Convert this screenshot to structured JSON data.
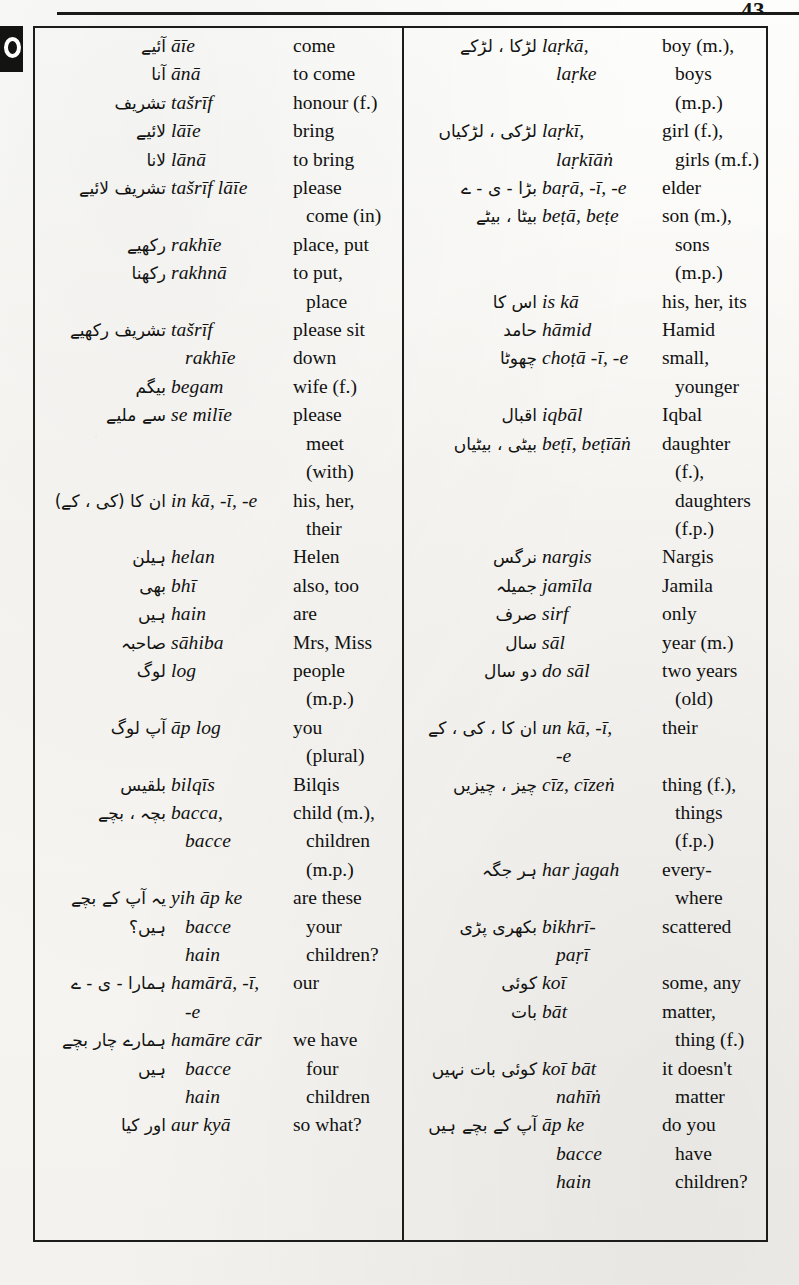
{
  "page": {
    "folio": "43",
    "thumb_tab_icon": "thumb-index-ring-icon"
  },
  "glossary": {
    "left_column": [
      {
        "urdu": "آئیے",
        "translit": "āīe",
        "gloss": "come"
      },
      {
        "urdu": "آنا",
        "translit": "ānā",
        "gloss": "to come"
      },
      {
        "urdu": "تشریف",
        "translit": "tašrīf",
        "gloss": "honour (f.)"
      },
      {
        "urdu": "لائیے",
        "translit": "lāīe",
        "gloss": "bring"
      },
      {
        "urdu": "لانا",
        "translit": "lānā",
        "gloss": "to bring"
      },
      {
        "urdu": "تشریف لائیے",
        "translit": "tašrīf lāīe",
        "gloss": "please"
      },
      {
        "urdu": "",
        "translit": "",
        "gloss": "come (in)",
        "cont": true,
        "indent_gloss": true
      },
      {
        "urdu": "رکھیے",
        "translit": "rakhīe",
        "gloss": "place, put"
      },
      {
        "urdu": "رکھنا",
        "translit": "rakhnā",
        "gloss": "to put,"
      },
      {
        "urdu": "",
        "translit": "",
        "gloss": "place",
        "cont": true,
        "indent_gloss": true
      },
      {
        "urdu": "تشریف رکھیے",
        "translit": "tašrīf",
        "gloss": "please sit"
      },
      {
        "urdu": "",
        "translit": "rakhīe",
        "gloss": "down",
        "cont": true,
        "indent_translit": true
      },
      {
        "urdu": "بیگم",
        "translit": "begam",
        "gloss": "wife (f.)"
      },
      {
        "urdu": "سے ملیے",
        "translit": "se milīe",
        "gloss": "please"
      },
      {
        "urdu": "",
        "translit": "",
        "gloss": "meet",
        "cont": true,
        "indent_gloss": true
      },
      {
        "urdu": "",
        "translit": "",
        "gloss": "(with)",
        "cont": true,
        "indent_gloss": true
      },
      {
        "urdu": "ان کا (کی ، کے)",
        "translit": "in kā, -ī, -e",
        "gloss": "his, her,"
      },
      {
        "urdu": "",
        "translit": "",
        "gloss": "their",
        "cont": true,
        "indent_gloss": true
      },
      {
        "urdu": "ہیلن",
        "translit": "helan",
        "gloss": "Helen"
      },
      {
        "urdu": "بھی",
        "translit": "bhī",
        "gloss": "also, too"
      },
      {
        "urdu": "ہیں",
        "translit": "hain",
        "gloss": "are"
      },
      {
        "urdu": "صاحبہ",
        "translit": "sāhiba",
        "gloss": "Mrs, Miss"
      },
      {
        "urdu": "لوگ",
        "translit": "log",
        "gloss": "people"
      },
      {
        "urdu": "",
        "translit": "",
        "gloss": "(m.p.)",
        "cont": true,
        "indent_gloss": true
      },
      {
        "urdu": "آپ لوگ",
        "translit": "āp log",
        "gloss": "you"
      },
      {
        "urdu": "",
        "translit": "",
        "gloss": "(plural)",
        "cont": true,
        "indent_gloss": true
      },
      {
        "urdu": "بلقیس",
        "translit": "bilqīs",
        "gloss": "Bilqis"
      },
      {
        "urdu": "بچہ ، بچے",
        "translit": "bacca,",
        "gloss": "child (m.),"
      },
      {
        "urdu": "",
        "translit": "bacce",
        "gloss": "children",
        "cont": true,
        "indent_translit": true,
        "indent_gloss": true
      },
      {
        "urdu": "",
        "translit": "",
        "gloss": "(m.p.)",
        "cont": true,
        "indent_gloss": true
      },
      {
        "urdu": "یہ آپ کے بچے",
        "translit": "yih āp ke",
        "gloss": "are these"
      },
      {
        "urdu": "ہیں؟",
        "translit": "bacce",
        "gloss": "your",
        "cont": false,
        "indent_translit": true,
        "indent_gloss": true
      },
      {
        "urdu": "",
        "translit": "hain",
        "gloss": "children?",
        "cont": true,
        "indent_translit": true,
        "indent_gloss": true
      },
      {
        "urdu": "ہمارا - ی - ے",
        "translit": "hamārā, -ī,",
        "gloss": "our"
      },
      {
        "urdu": "",
        "translit": "-e",
        "gloss": "",
        "cont": true,
        "indent_translit": true
      },
      {
        "urdu": "ہمارے چار بچے",
        "translit": "hamāre cār",
        "gloss": "we have"
      },
      {
        "urdu": "ہیں",
        "translit": "bacce",
        "gloss": "four",
        "cont": false,
        "indent_translit": true,
        "indent_gloss": true
      },
      {
        "urdu": "",
        "translit": "hain",
        "gloss": "children",
        "cont": true,
        "indent_translit": true,
        "indent_gloss": true
      },
      {
        "urdu": "اور کیا",
        "translit": "aur kyā",
        "gloss": "so what?"
      }
    ],
    "right_column": [
      {
        "urdu": "لڑکا ، لڑکے",
        "translit": "laṛkā,",
        "gloss": "boy (m.),"
      },
      {
        "urdu": "",
        "translit": "laṛke",
        "gloss": "boys",
        "cont": true,
        "indent_translit": true,
        "indent_gloss": true
      },
      {
        "urdu": "",
        "translit": "",
        "gloss": "(m.p.)",
        "cont": true,
        "indent_gloss": true
      },
      {
        "urdu": "لڑکی ، لڑکیاں",
        "translit": "laṛkī,",
        "gloss": "girl (f.),"
      },
      {
        "urdu": "",
        "translit": "laṛkīāṅ",
        "gloss": "girls (m.f.)",
        "cont": true,
        "indent_translit": true,
        "indent_gloss": true
      },
      {
        "urdu": "بڑا - ی - ے",
        "translit": "baṛā, -ī, -e",
        "gloss": "elder"
      },
      {
        "urdu": "بیٹا ، بیٹے",
        "translit": "beṭā, beṭe",
        "gloss": "son (m.),"
      },
      {
        "urdu": "",
        "translit": "",
        "gloss": "sons",
        "cont": true,
        "indent_gloss": true
      },
      {
        "urdu": "",
        "translit": "",
        "gloss": "(m.p.)",
        "cont": true,
        "indent_gloss": true
      },
      {
        "urdu": "اس کا",
        "translit": "is kā",
        "gloss": "his, her, its"
      },
      {
        "urdu": "حامد",
        "translit": "hāmid",
        "gloss": "Hamid"
      },
      {
        "urdu": "چھوٹا",
        "translit": "choṭā -ī, -e",
        "gloss": "small,"
      },
      {
        "urdu": "",
        "translit": "",
        "gloss": "younger",
        "cont": true,
        "indent_gloss": true
      },
      {
        "urdu": "اقبال",
        "translit": "iqbāl",
        "gloss": "Iqbal"
      },
      {
        "urdu": "بیٹی ، بیٹیاں",
        "translit": "beṭī, beṭīāṅ",
        "gloss": "daughter"
      },
      {
        "urdu": "",
        "translit": "",
        "gloss": "(f.),",
        "cont": true,
        "indent_gloss": true
      },
      {
        "urdu": "",
        "translit": "",
        "gloss": "daughters",
        "cont": true,
        "indent_gloss": true
      },
      {
        "urdu": "",
        "translit": "",
        "gloss": "(f.p.)",
        "cont": true,
        "indent_gloss": true
      },
      {
        "urdu": "نرگس",
        "translit": "nargis",
        "gloss": "Nargis"
      },
      {
        "urdu": "جمیلہ",
        "translit": "jamīla",
        "gloss": "Jamila"
      },
      {
        "urdu": "صرف",
        "translit": "sirf",
        "gloss": "only"
      },
      {
        "urdu": "سال",
        "translit": "sāl",
        "gloss": "year (m.)"
      },
      {
        "urdu": "دو سال",
        "translit": "do sāl",
        "gloss": "two years"
      },
      {
        "urdu": "",
        "translit": "",
        "gloss": "(old)",
        "cont": true,
        "indent_gloss": true
      },
      {
        "urdu": "ان کا ، کی ، کے",
        "translit": "un kā, -ī,",
        "gloss": "their"
      },
      {
        "urdu": "",
        "translit": "-e",
        "gloss": "",
        "cont": true,
        "indent_translit": true
      },
      {
        "urdu": "چیز ، چیزیں",
        "translit": "cīz, cīzeṅ",
        "gloss": "thing (f.),"
      },
      {
        "urdu": "",
        "translit": "",
        "gloss": "things",
        "cont": true,
        "indent_gloss": true
      },
      {
        "urdu": "",
        "translit": "",
        "gloss": "(f.p.)",
        "cont": true,
        "indent_gloss": true
      },
      {
        "urdu": "ہر جگہ",
        "translit": "har jagah",
        "gloss": "every-"
      },
      {
        "urdu": "",
        "translit": "",
        "gloss": "where",
        "cont": true,
        "indent_gloss": true
      },
      {
        "urdu": "بکھری پڑی",
        "translit": "bikhrī-",
        "gloss": "scattered"
      },
      {
        "urdu": "",
        "translit": "paṛī",
        "gloss": "",
        "cont": true,
        "indent_translit": true
      },
      {
        "urdu": "کوئی",
        "translit": "koī",
        "gloss": "some, any"
      },
      {
        "urdu": "بات",
        "translit": "bāt",
        "gloss": "matter,"
      },
      {
        "urdu": "",
        "translit": "",
        "gloss": "thing (f.)",
        "cont": true,
        "indent_gloss": true
      },
      {
        "urdu": "کوئی بات نہیں",
        "translit": "koī bāt",
        "gloss": "it doesn't"
      },
      {
        "urdu": "",
        "translit": "nahīṅ",
        "gloss": "matter",
        "cont": true,
        "indent_translit": true,
        "indent_gloss": true
      },
      {
        "urdu": "آپ کے بچے ہیں",
        "translit": "āp ke",
        "gloss": "do you"
      },
      {
        "urdu": "",
        "translit": "bacce",
        "gloss": "have",
        "cont": true,
        "indent_translit": true,
        "indent_gloss": true
      },
      {
        "urdu": "",
        "translit": "hain",
        "gloss": "children?",
        "cont": true,
        "indent_translit": true,
        "indent_gloss": true
      }
    ]
  }
}
